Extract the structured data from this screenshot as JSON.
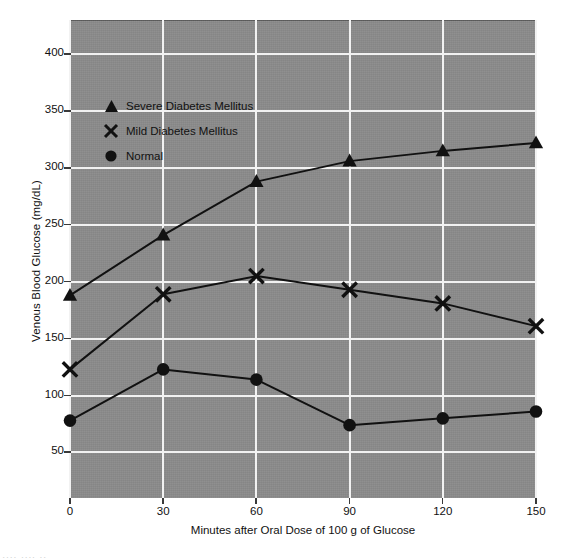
{
  "chart_data": {
    "type": "line",
    "title": "",
    "xlabel": "Minutes after Oral Dose of 100 g of Glucose",
    "ylabel": "Venous Blood Glucose (mg/dL)",
    "x": [
      0,
      30,
      60,
      90,
      120,
      150
    ],
    "xtick_labels": [
      "0",
      "30",
      "60",
      "90",
      "120",
      "150"
    ],
    "ytick_labels": [
      "50",
      "100",
      "150",
      "200",
      "250",
      "300",
      "350",
      "400"
    ],
    "yticks": [
      50,
      100,
      150,
      200,
      250,
      300,
      350,
      400
    ],
    "xlim": [
      0,
      150
    ],
    "ylim": [
      10,
      430
    ],
    "grid": true,
    "legend_position": "upper-left-inside",
    "series": [
      {
        "name": "Severe Diabetes Mellitus",
        "marker": "triangle",
        "values": [
          188,
          241,
          288,
          306,
          315,
          322
        ]
      },
      {
        "name": "Mild Diabetes Mellitus",
        "marker": "x",
        "values": [
          123,
          189,
          205,
          193,
          181,
          161
        ]
      },
      {
        "name": "Normal",
        "marker": "circle",
        "values": [
          78,
          123,
          114,
          74,
          80,
          86
        ]
      }
    ],
    "colors": {
      "plot_background": "#8b8b8b",
      "gridline": "#f2f2f2",
      "series_line": "#111111",
      "marker": "#111111",
      "text": "#111111",
      "page_background": "#ffffff"
    }
  },
  "legend": {
    "items": [
      {
        "label": "Severe Diabetes Mellitus",
        "marker": "triangle-marker"
      },
      {
        "label": "Mild Diabetes Mellitus",
        "marker": "x-marker"
      },
      {
        "label": "Normal",
        "marker": "circle-marker"
      }
    ]
  },
  "caption_sliver": "....  .... .."
}
